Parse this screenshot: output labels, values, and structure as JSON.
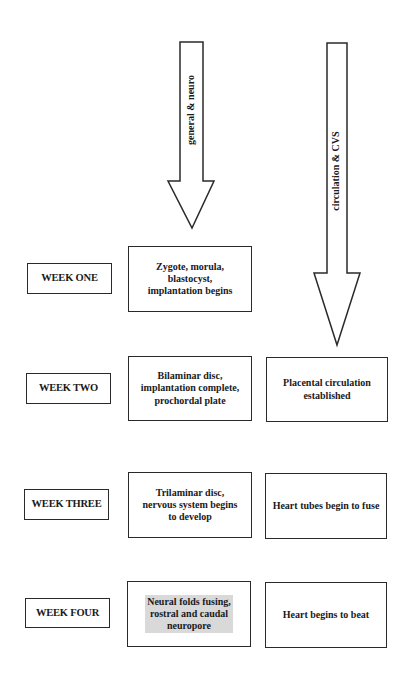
{
  "arrows": [
    {
      "label": "general & neuro",
      "direction": "down",
      "column": "general-neuro"
    },
    {
      "label": "circulation & CVS",
      "direction": "down",
      "column": "circulation-cvs"
    }
  ],
  "weeks": [
    {
      "label": "WEEK ONE",
      "general_neuro": "Zygote, morula,\nblastocyst,\nimplantation begins",
      "circulation_cvs": null
    },
    {
      "label": "WEEK TWO",
      "general_neuro": "Bilaminar disc,\nimplantation complete,\nprochordal plate",
      "circulation_cvs": "Placental circulation\nestablished"
    },
    {
      "label": "WEEK THREE",
      "general_neuro": "Trilaminar disc,\nnervous system begins\nto develop",
      "circulation_cvs": "Heart tubes begin to fuse"
    },
    {
      "label": "WEEK FOUR",
      "general_neuro": "Neural folds fusing,\nrostral and caudal\nneuropore",
      "circulation_cvs": "Heart begins to beat"
    }
  ],
  "colors": {
    "stroke": "#2a2a2a",
    "background": "#ffffff",
    "highlight": "#d9d9d9"
  }
}
